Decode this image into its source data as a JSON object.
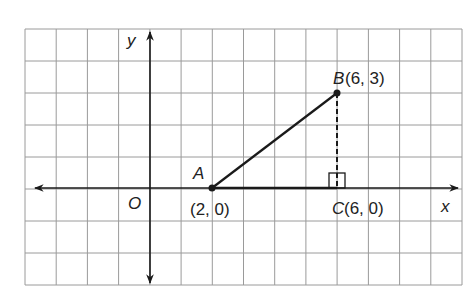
{
  "diagram": {
    "type": "coordinate-grid",
    "grid": {
      "columns": 14,
      "rows": 8,
      "origin_col": 4,
      "origin_row": 5
    },
    "axes": {
      "x_label": "x",
      "y_label": "y",
      "origin_label": "O"
    },
    "points": [
      {
        "name": "A",
        "coord_label": "(2, 0)",
        "x": 2,
        "y": 0
      },
      {
        "name": "B",
        "coord_label": "(6, 3)",
        "x": 6,
        "y": 3
      },
      {
        "name": "C",
        "coord_label": "(6, 0)",
        "x": 6,
        "y": 0
      }
    ],
    "segments": [
      {
        "from": "A",
        "to": "B",
        "style": "solid"
      },
      {
        "from": "A",
        "to": "C",
        "style": "solid"
      },
      {
        "from": "B",
        "to": "C",
        "style": "dashed"
      }
    ],
    "right_angle_at": "C",
    "colors": {
      "grid": "#9a9a9a",
      "ink": "#1a1a1a"
    }
  }
}
